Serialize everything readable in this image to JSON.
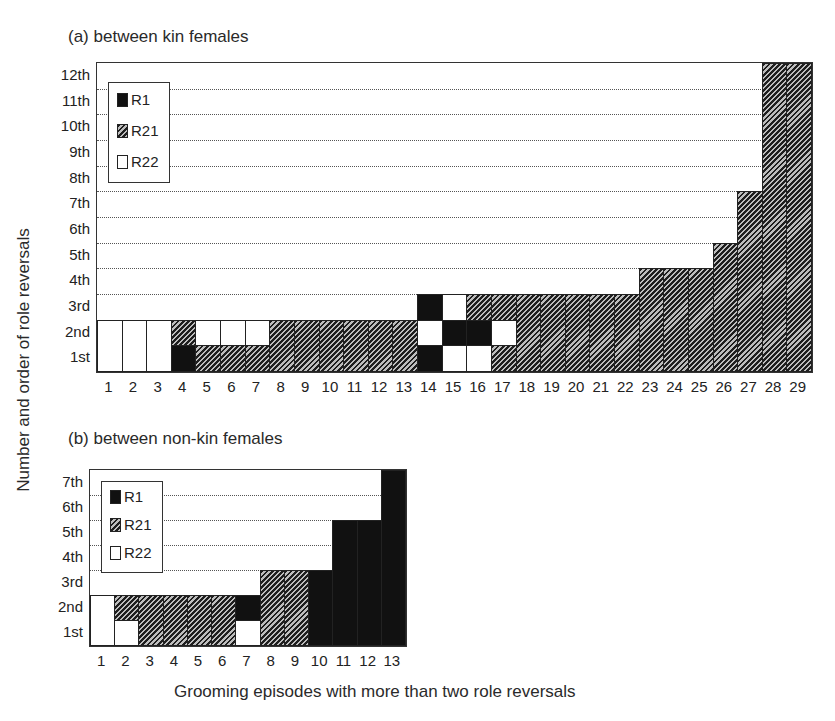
{
  "figure": {
    "y_axis_title": "Number and order of role reversals",
    "x_axis_title": "Grooming episodes with more than two role reversals"
  },
  "legend": {
    "items": [
      {
        "key": "R1",
        "label": "R1",
        "color": "#111111"
      },
      {
        "key": "R21",
        "label": "R21",
        "color": "hatched"
      },
      {
        "key": "R22",
        "label": "R22",
        "color": "#ffffff"
      }
    ]
  },
  "panels": {
    "a": {
      "title": "(a) between kin females",
      "y_ticks": [
        "1st",
        "2nd",
        "3rd",
        "4th",
        "5th",
        "6th",
        "7th",
        "8th",
        "9th",
        "10th",
        "11th",
        "12th"
      ],
      "x_ticks": [
        "1",
        "2",
        "3",
        "4",
        "5",
        "6",
        "7",
        "8",
        "9",
        "10",
        "11",
        "12",
        "13",
        "14",
        "15",
        "16",
        "17",
        "18",
        "19",
        "20",
        "21",
        "22",
        "23",
        "24",
        "25",
        "26",
        "27",
        "28",
        "29"
      ]
    },
    "b": {
      "title": "(b) between non-kin females",
      "y_ticks": [
        "1st",
        "2nd",
        "3rd",
        "4th",
        "5th",
        "6th",
        "7th"
      ],
      "x_ticks": [
        "1",
        "2",
        "3",
        "4",
        "5",
        "6",
        "7",
        "8",
        "9",
        "10",
        "11",
        "12",
        "13"
      ]
    }
  },
  "chart_data": [
    {
      "type": "heatmap",
      "title": "(a) between kin females",
      "xlabel": "Grooming episodes with more than two role reversals",
      "ylabel": "Number and order of role reversals",
      "legend": [
        "R1",
        "R21",
        "R22"
      ],
      "legend_position": "upper left (inside plot)",
      "grid": "dotted horizontal",
      "ylim": [
        0,
        12
      ],
      "note": "Each column is one grooming episode; stacked cells (bottom=1st) give the type of each successive role reversal. Single tall cells span multiple rows.",
      "episodes": [
        {
          "x": 1,
          "segments": [
            {
              "type": "R22",
              "from": 0,
              "to": 2
            }
          ]
        },
        {
          "x": 2,
          "segments": [
            {
              "type": "R22",
              "from": 0,
              "to": 2
            }
          ]
        },
        {
          "x": 3,
          "segments": [
            {
              "type": "R22",
              "from": 0,
              "to": 2
            }
          ]
        },
        {
          "x": 4,
          "segments": [
            {
              "type": "R1",
              "from": 0,
              "to": 1
            },
            {
              "type": "R21",
              "from": 1,
              "to": 2
            }
          ]
        },
        {
          "x": 5,
          "segments": [
            {
              "type": "R21",
              "from": 0,
              "to": 1
            },
            {
              "type": "R22",
              "from": 1,
              "to": 2
            }
          ]
        },
        {
          "x": 6,
          "segments": [
            {
              "type": "R21",
              "from": 0,
              "to": 1
            },
            {
              "type": "R22",
              "from": 1,
              "to": 2
            }
          ]
        },
        {
          "x": 7,
          "segments": [
            {
              "type": "R21",
              "from": 0,
              "to": 1
            },
            {
              "type": "R22",
              "from": 1,
              "to": 2
            }
          ]
        },
        {
          "x": 8,
          "segments": [
            {
              "type": "R21",
              "from": 0,
              "to": 2
            }
          ]
        },
        {
          "x": 9,
          "segments": [
            {
              "type": "R21",
              "from": 0,
              "to": 2
            }
          ]
        },
        {
          "x": 10,
          "segments": [
            {
              "type": "R21",
              "from": 0,
              "to": 2
            }
          ]
        },
        {
          "x": 11,
          "segments": [
            {
              "type": "R21",
              "from": 0,
              "to": 2
            }
          ]
        },
        {
          "x": 12,
          "segments": [
            {
              "type": "R21",
              "from": 0,
              "to": 2
            }
          ]
        },
        {
          "x": 13,
          "segments": [
            {
              "type": "R21",
              "from": 0,
              "to": 2
            }
          ]
        },
        {
          "x": 14,
          "segments": [
            {
              "type": "R1",
              "from": 0,
              "to": 1
            },
            {
              "type": "R22",
              "from": 1,
              "to": 2
            },
            {
              "type": "R1",
              "from": 2,
              "to": 3
            }
          ]
        },
        {
          "x": 15,
          "segments": [
            {
              "type": "R22",
              "from": 0,
              "to": 1
            },
            {
              "type": "R1",
              "from": 1,
              "to": 2
            },
            {
              "type": "R22",
              "from": 2,
              "to": 3
            }
          ]
        },
        {
          "x": 16,
          "segments": [
            {
              "type": "R22",
              "from": 0,
              "to": 1
            },
            {
              "type": "R1",
              "from": 1,
              "to": 2
            },
            {
              "type": "R21",
              "from": 2,
              "to": 3
            }
          ]
        },
        {
          "x": 17,
          "segments": [
            {
              "type": "R21",
              "from": 0,
              "to": 1
            },
            {
              "type": "R22",
              "from": 1,
              "to": 2
            },
            {
              "type": "R21",
              "from": 2,
              "to": 3
            }
          ]
        },
        {
          "x": 18,
          "segments": [
            {
              "type": "R21",
              "from": 0,
              "to": 3
            }
          ]
        },
        {
          "x": 19,
          "segments": [
            {
              "type": "R21",
              "from": 0,
              "to": 3
            }
          ]
        },
        {
          "x": 20,
          "segments": [
            {
              "type": "R21",
              "from": 0,
              "to": 3
            }
          ]
        },
        {
          "x": 21,
          "segments": [
            {
              "type": "R21",
              "from": 0,
              "to": 3
            }
          ]
        },
        {
          "x": 22,
          "segments": [
            {
              "type": "R21",
              "from": 0,
              "to": 3
            }
          ]
        },
        {
          "x": 23,
          "segments": [
            {
              "type": "R21",
              "from": 0,
              "to": 4
            }
          ]
        },
        {
          "x": 24,
          "segments": [
            {
              "type": "R21",
              "from": 0,
              "to": 4
            }
          ]
        },
        {
          "x": 25,
          "segments": [
            {
              "type": "R21",
              "from": 0,
              "to": 4
            }
          ]
        },
        {
          "x": 26,
          "segments": [
            {
              "type": "R21",
              "from": 0,
              "to": 5
            }
          ]
        },
        {
          "x": 27,
          "segments": [
            {
              "type": "R21",
              "from": 0,
              "to": 7
            }
          ]
        },
        {
          "x": 28,
          "segments": [
            {
              "type": "R21",
              "from": 0,
              "to": 12
            }
          ]
        },
        {
          "x": 29,
          "segments": [
            {
              "type": "R21",
              "from": 0,
              "to": 12
            }
          ]
        }
      ]
    },
    {
      "type": "heatmap",
      "title": "(b) between non-kin females",
      "xlabel": "Grooming episodes with more than two role reversals",
      "ylabel": "Number and order of role reversals",
      "legend": [
        "R1",
        "R21",
        "R22"
      ],
      "legend_position": "upper left (inside plot)",
      "grid": "dotted horizontal",
      "ylim": [
        0,
        7
      ],
      "episodes": [
        {
          "x": 1,
          "segments": [
            {
              "type": "R22",
              "from": 0,
              "to": 2
            }
          ]
        },
        {
          "x": 2,
          "segments": [
            {
              "type": "R22",
              "from": 0,
              "to": 1
            },
            {
              "type": "R21",
              "from": 1,
              "to": 2
            }
          ]
        },
        {
          "x": 3,
          "segments": [
            {
              "type": "R21",
              "from": 0,
              "to": 2
            }
          ]
        },
        {
          "x": 4,
          "segments": [
            {
              "type": "R21",
              "from": 0,
              "to": 2
            }
          ]
        },
        {
          "x": 5,
          "segments": [
            {
              "type": "R21",
              "from": 0,
              "to": 2
            }
          ]
        },
        {
          "x": 6,
          "segments": [
            {
              "type": "R21",
              "from": 0,
              "to": 2
            }
          ]
        },
        {
          "x": 7,
          "segments": [
            {
              "type": "R22",
              "from": 0,
              "to": 1
            },
            {
              "type": "R1",
              "from": 1,
              "to": 2
            }
          ]
        },
        {
          "x": 8,
          "segments": [
            {
              "type": "R21",
              "from": 0,
              "to": 3
            }
          ]
        },
        {
          "x": 9,
          "segments": [
            {
              "type": "R21",
              "from": 0,
              "to": 3
            }
          ]
        },
        {
          "x": 10,
          "segments": [
            {
              "type": "R1",
              "from": 0,
              "to": 3
            }
          ]
        },
        {
          "x": 11,
          "segments": [
            {
              "type": "R1",
              "from": 0,
              "to": 5
            }
          ]
        },
        {
          "x": 12,
          "segments": [
            {
              "type": "R1",
              "from": 0,
              "to": 5
            }
          ]
        },
        {
          "x": 13,
          "segments": [
            {
              "type": "R1",
              "from": 0,
              "to": 7
            }
          ]
        }
      ]
    }
  ]
}
